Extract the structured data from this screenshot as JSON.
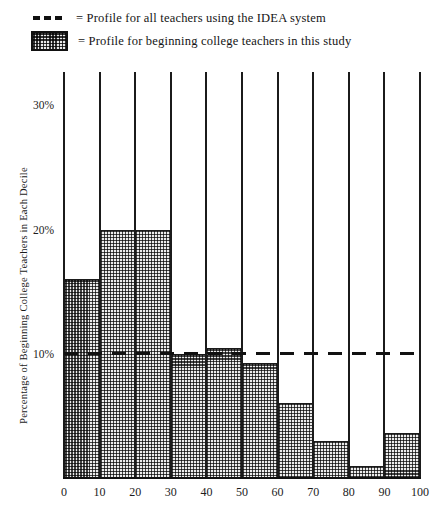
{
  "legend": {
    "items": [
      {
        "swatch": "dashed-line-swatch",
        "text": "= Profile for all teachers using the IDEA system"
      },
      {
        "swatch": "checkered-box-swatch",
        "text": "= Profile for beginning college teachers in this study"
      }
    ]
  },
  "axes": {
    "ylabel": "Percentage of Beginning College Teachers in Each Decile",
    "yticks": [
      "10%",
      "20%",
      "30%"
    ],
    "ytick_values": [
      10,
      20,
      30
    ],
    "xticks": [
      "0",
      "10",
      "20",
      "30",
      "40",
      "50",
      "60",
      "70",
      "80",
      "90",
      "100"
    ],
    "xtick_values": [
      0,
      10,
      20,
      30,
      40,
      50,
      60,
      70,
      80,
      90,
      100
    ]
  },
  "colors": {
    "line": "#1b1b1b",
    "bar_fill": "#ececec",
    "bar_hatch": "#4a4a4a",
    "text": "#1a1a1a",
    "background": "#ffffff"
  },
  "chart_data": {
    "type": "bar",
    "title": "",
    "xlabel": "",
    "ylabel": "Percentage of Beginning College Teachers in Each Decile",
    "categories": [
      "0-10",
      "10-20",
      "20-30",
      "30-40",
      "40-50",
      "50-60",
      "60-70",
      "70-80",
      "80-90",
      "90-100"
    ],
    "values": [
      16,
      20,
      20,
      10,
      10.5,
      9.3,
      6,
      3,
      1,
      3.6
    ],
    "xlim": [
      0,
      100
    ],
    "ylim": [
      0,
      32.7
    ],
    "grid": false,
    "legend_position": "above-plot",
    "series": [
      {
        "name": "Profile for beginning college teachers in this study",
        "type": "bar",
        "values": [
          16,
          20,
          20,
          10,
          10.5,
          9.3,
          6,
          3,
          1,
          3.6
        ]
      },
      {
        "name": "Profile for all teachers using the IDEA system",
        "type": "reference-line",
        "value": 10
      }
    ],
    "reference_line": {
      "value": 10,
      "style": "dashed"
    }
  }
}
